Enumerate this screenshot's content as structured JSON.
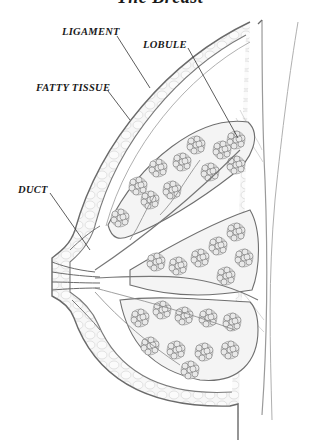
{
  "diagram": {
    "title": "The Breast",
    "labels": {
      "ligament": "LIGAMENT",
      "lobule": "LOBULE",
      "fatty_tissue": "FATTY TISSUE",
      "duct": "DUCT"
    },
    "style": {
      "line_color": "#555555",
      "label_color": "#1a1a1a",
      "background": "#ffffff"
    }
  }
}
